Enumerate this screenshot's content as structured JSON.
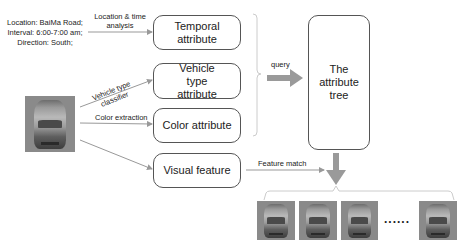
{
  "info": {
    "lines": [
      "Location: BaiMa Road;",
      "Interval: 6:00-7:00 am;",
      "Direction: South;"
    ]
  },
  "edges": {
    "location_time": "Location & time analysis",
    "vehicle_type": "Vehicle type classifier",
    "color_extraction": "Color extraction",
    "query": "query",
    "feature_match": "Feature match"
  },
  "boxes": {
    "temporal": "Temporal  attribute",
    "vehicle_type": "Vehicle type attribute",
    "color": "Color attribute",
    "visual": "Visual feature",
    "attribute_tree": "The attribute tree"
  },
  "results": {
    "count_shown": 4,
    "ellipsis": "......"
  },
  "colors": {
    "arrow_gray": "#999999",
    "box_border": "#555555"
  }
}
